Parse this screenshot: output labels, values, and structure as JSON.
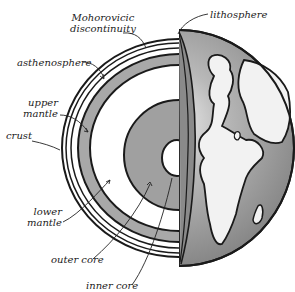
{
  "diagram": {
    "title": "",
    "labels": {
      "moho_line1": "Mohorovicic",
      "moho_line2": "discontinuity",
      "lithosphere": "lithosphere",
      "asthenosphere": "asthenosphere",
      "upper_mantle_line1": "upper",
      "upper_mantle_line2": "mantle",
      "crust": "crust",
      "lower_mantle_line1": "lower",
      "lower_mantle_line2": "mantle",
      "outer_core": "outer core",
      "inner_core": "inner core"
    },
    "colors": {
      "outline": "#1a1a1a",
      "mantle_band": "#a8a8a8",
      "outer_core": "#9a9a9a",
      "ocean": "#8c8c8c",
      "land": "#f2f2f2",
      "background": "#ffffff"
    }
  }
}
